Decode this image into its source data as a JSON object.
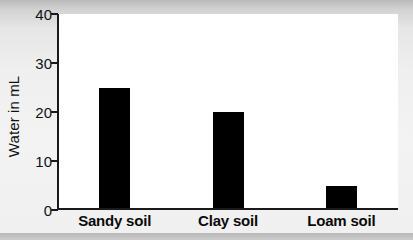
{
  "chart_data": {
    "type": "bar",
    "title": "",
    "xlabel": "",
    "ylabel": "Water in mL",
    "categories": [
      "Sandy soil",
      "Clay soil",
      "Loam soil"
    ],
    "values": [
      25,
      20,
      5
    ],
    "ylim": [
      0,
      40
    ],
    "yticks": [
      0,
      10,
      20,
      30,
      40
    ],
    "ytick_labels": [
      "0",
      "10",
      "20",
      "30",
      "40"
    ],
    "grid": false,
    "legend": null,
    "bar_color": "#000000",
    "plot_background": "#ffffff",
    "figure_background": "#f0f0f0",
    "axis_color": "#1a1a1a"
  }
}
